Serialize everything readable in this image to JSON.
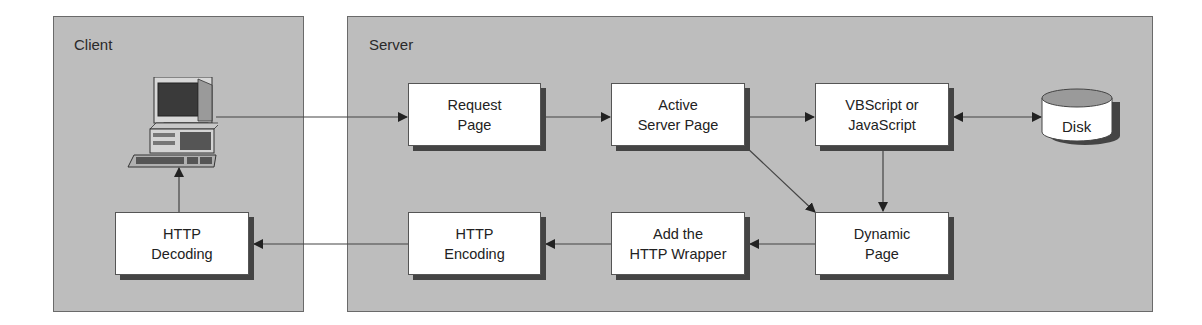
{
  "panels": {
    "client": {
      "title": "Client"
    },
    "server": {
      "title": "Server"
    }
  },
  "nodes": {
    "computer": {
      "label": "",
      "icon": "desktop-computer-icon"
    },
    "request_page": {
      "line1": "Request",
      "line2": "Page"
    },
    "active_server_page": {
      "line1": "Active",
      "line2": "Server Page"
    },
    "script": {
      "line1": "VBScript or",
      "line2": "JavaScript"
    },
    "disk": {
      "label": "Disk"
    },
    "dynamic_page": {
      "line1": "Dynamic",
      "line2": "Page"
    },
    "add_wrapper": {
      "line1": "Add the",
      "line2": "HTTP Wrapper"
    },
    "http_encoding": {
      "line1": "HTTP",
      "line2": "Encoding"
    },
    "http_decoding": {
      "line1": "HTTP",
      "line2": "Decoding"
    }
  },
  "edges": [
    {
      "from": "computer",
      "to": "request_page"
    },
    {
      "from": "request_page",
      "to": "active_server_page"
    },
    {
      "from": "active_server_page",
      "to": "script"
    },
    {
      "from": "script",
      "to": "disk",
      "bidirectional": true
    },
    {
      "from": "script",
      "to": "dynamic_page"
    },
    {
      "from": "active_server_page",
      "to": "dynamic_page"
    },
    {
      "from": "dynamic_page",
      "to": "add_wrapper"
    },
    {
      "from": "add_wrapper",
      "to": "http_encoding"
    },
    {
      "from": "http_encoding",
      "to": "http_decoding"
    },
    {
      "from": "http_decoding",
      "to": "computer"
    }
  ],
  "colors": {
    "panel": "#bdbdbd",
    "box": "#ffffff",
    "shadow": "#444444",
    "line": "#333333"
  }
}
